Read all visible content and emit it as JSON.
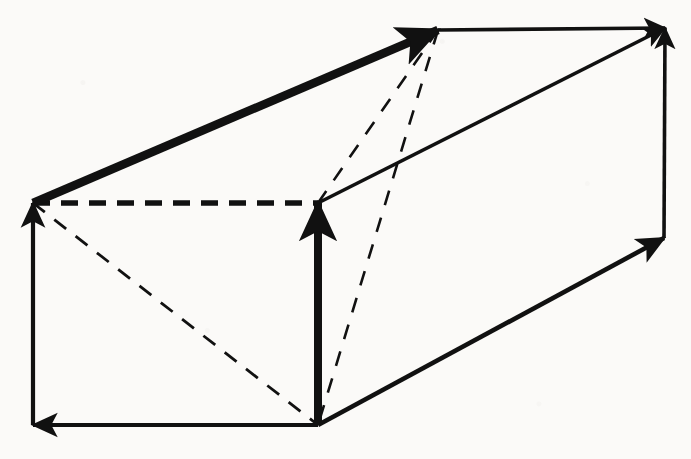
{
  "figure": {
    "background_color": "#fbfaf8",
    "ink_color": "#111111",
    "width": 691,
    "height": 459
  },
  "geometry": {
    "vertices": {
      "back_top_left": {
        "name": "A",
        "x": 33,
        "y": 203
      },
      "front_top_left": {
        "name": "B",
        "x": 318,
        "y": 203
      },
      "front_bottom_left": {
        "name": "C",
        "x": 318,
        "y": 425
      },
      "back_bottom_left": {
        "name": "D",
        "x": 33,
        "y": 425
      },
      "back_top_right": {
        "name": "E",
        "x": 438,
        "y": 30
      },
      "front_top_right": {
        "name": "F",
        "x": 665,
        "y": 28
      },
      "front_bottom_right": {
        "name": "G",
        "x": 664,
        "y": 238
      }
    },
    "edges": [
      {
        "id": "edge-a-to-e",
        "label": "A to E",
        "from": "back_top_left",
        "to": "back_top_right",
        "style": "solid",
        "weight": "thick",
        "arrow": "end"
      },
      {
        "id": "edge-c-to-b",
        "label": "C to B",
        "from": "front_bottom_left",
        "to": "front_top_left",
        "style": "solid",
        "weight": "thick",
        "arrow": "end"
      },
      {
        "id": "edge-d-to-a",
        "label": "D to A",
        "from": "back_bottom_left",
        "to": "back_top_left",
        "style": "solid",
        "weight": "medium",
        "arrow": "end"
      },
      {
        "id": "edge-c-to-d",
        "label": "C to D",
        "from": "front_bottom_left",
        "to": "back_bottom_left",
        "style": "solid",
        "weight": "medium",
        "arrow": "end"
      },
      {
        "id": "edge-b-to-f",
        "label": "B to F",
        "from": "front_top_left",
        "to": "front_top_right",
        "style": "solid",
        "weight": "medium",
        "arrow": "end"
      },
      {
        "id": "edge-c-to-g",
        "label": "C to G",
        "from": "front_bottom_left",
        "to": "front_bottom_right",
        "style": "solid",
        "weight": "medium",
        "arrow": "end"
      },
      {
        "id": "edge-g-to-f",
        "label": "G to F",
        "from": "front_bottom_right",
        "to": "front_top_right",
        "style": "solid",
        "weight": "medium",
        "arrow": "end"
      },
      {
        "id": "edge-e-to-f",
        "label": "E to F",
        "from": "back_top_right",
        "to": "front_top_right",
        "style": "solid",
        "weight": "medium",
        "arrow": "end"
      },
      {
        "id": "edge-a-to-b",
        "label": "A to B",
        "from": "back_top_left",
        "to": "front_top_left",
        "style": "dashed",
        "weight": "heavy-dash",
        "arrow": "none"
      },
      {
        "id": "edge-a-to-c",
        "label": "A to C",
        "from": "back_top_left",
        "to": "front_bottom_left",
        "style": "dashed",
        "weight": "light-dash",
        "arrow": "none"
      },
      {
        "id": "edge-e-to-b",
        "label": "E to B",
        "from": "back_top_right",
        "to": "front_top_left",
        "style": "dashed",
        "weight": "light-dash",
        "arrow": "none"
      },
      {
        "id": "edge-e-to-c",
        "label": "E to C",
        "from": "back_top_right",
        "to": "front_bottom_left",
        "style": "dashed",
        "weight": "light-dash",
        "arrow": "none"
      }
    ]
  }
}
